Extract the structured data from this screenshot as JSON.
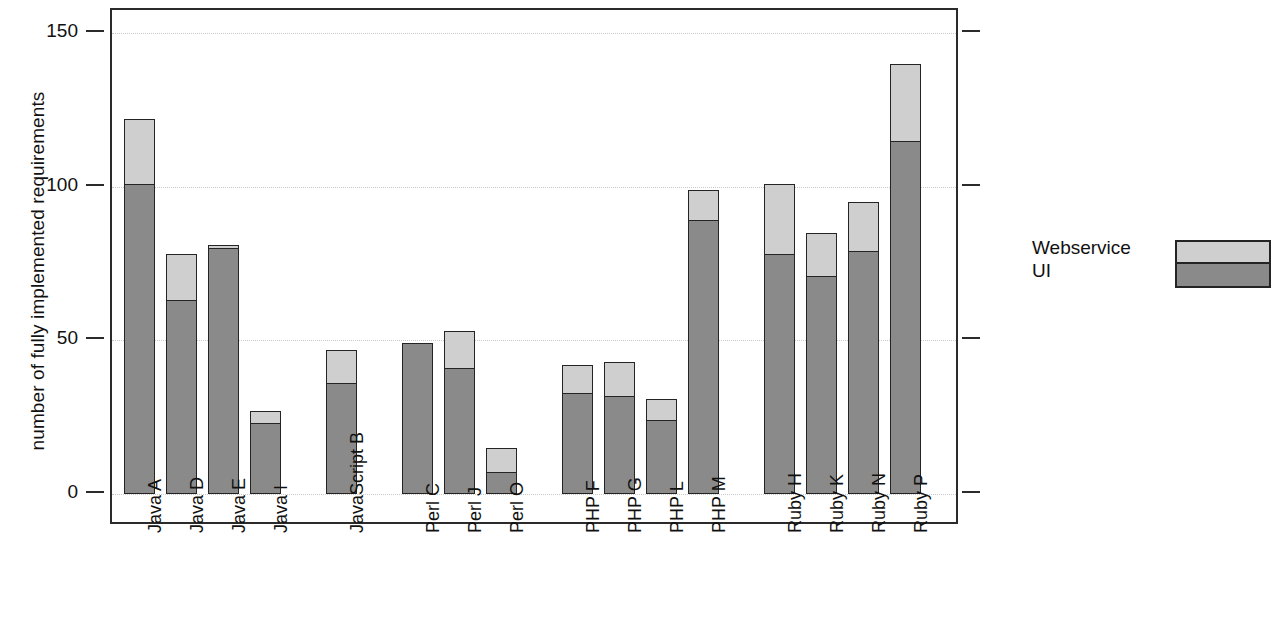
{
  "chart_data": {
    "type": "bar",
    "subtype": "stacked",
    "title": "",
    "xlabel": "",
    "ylabel": "number of fully implemented requirements",
    "ylim": [
      0,
      150
    ],
    "yticks": [
      0,
      50,
      100,
      150
    ],
    "ytick_labels": [
      "0",
      "50",
      "100",
      "150"
    ],
    "grid": true,
    "grid_axis": "y",
    "legend_position": "right",
    "categories": [
      "Java A",
      "Java D",
      "Java E",
      "Java I",
      "JavaScript B",
      "Perl C",
      "Perl J",
      "Perl O",
      "PHP F",
      "PHP G",
      "PHP L",
      "PHP M",
      "Ruby H",
      "Ruby K",
      "Ruby N",
      "Ruby P"
    ],
    "groups": [
      {
        "name": "Java",
        "members": [
          "Java A",
          "Java D",
          "Java E",
          "Java I"
        ]
      },
      {
        "name": "JavaScript",
        "members": [
          "JavaScript B"
        ]
      },
      {
        "name": "Perl",
        "members": [
          "Perl C",
          "Perl J",
          "Perl O"
        ]
      },
      {
        "name": "PHP",
        "members": [
          "PHP F",
          "PHP G",
          "PHP L",
          "PHP M"
        ]
      },
      {
        "name": "Ruby",
        "members": [
          "Ruby H",
          "Ruby K",
          "Ruby N",
          "Ruby P"
        ]
      }
    ],
    "series": [
      {
        "name": "UI",
        "color": "#8a8a8a",
        "values": [
          101,
          63,
          80,
          23,
          36,
          49,
          41,
          7,
          33,
          32,
          24,
          89,
          78,
          71,
          79,
          115
        ]
      },
      {
        "name": "Webservice",
        "color": "#cfcfcf",
        "values": [
          21,
          15,
          1,
          4,
          11,
          0,
          12,
          8,
          9,
          11,
          7,
          10,
          23,
          14,
          16,
          25
        ]
      }
    ],
    "totals": [
      122,
      78,
      81,
      27,
      47,
      49,
      53,
      15,
      42,
      43,
      31,
      99,
      101,
      85,
      95,
      140
    ]
  },
  "legend": {
    "entries": [
      {
        "label": "Webservice",
        "color": "#cfcfcf"
      },
      {
        "label": "UI",
        "color": "#8a8a8a"
      }
    ],
    "label_webservice": "Webservice",
    "label_ui": "UI"
  },
  "axis": {
    "y_title": "number of fully implemented requirements",
    "y_tick_0": "0",
    "y_tick_50": "50",
    "y_tick_100": "100",
    "y_tick_150": "150"
  }
}
